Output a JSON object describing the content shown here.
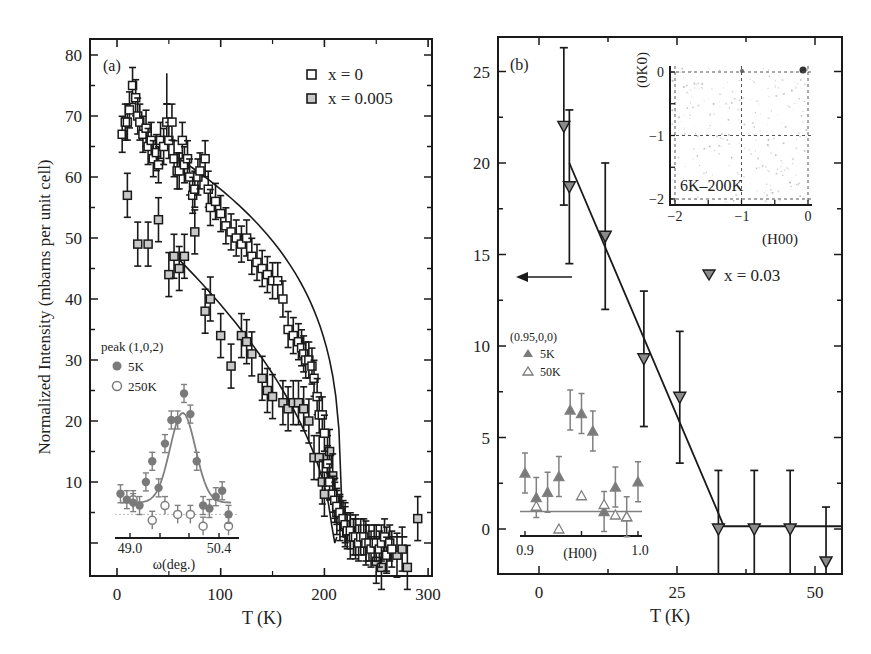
{
  "chart_data": [
    {
      "panel": "(a)",
      "type": "scatter",
      "title": "",
      "xlabel": "T (K)",
      "ylabel": "Normalized Intensity (mbarns per unit cell)",
      "xlim": [
        -25,
        305
      ],
      "ylim": [
        -5.5,
        82.5
      ],
      "xticks": [
        0,
        100,
        200,
        300
      ],
      "yticks": [
        10,
        20,
        30,
        40,
        50,
        60,
        70,
        80
      ],
      "grid": false,
      "legend_position": "upper right",
      "series": [
        {
          "name": "x = 0",
          "marker": "square-open",
          "x": [
            5,
            8,
            10,
            12,
            15,
            18,
            20,
            22,
            25,
            28,
            30,
            33,
            35,
            38,
            40,
            42,
            45,
            48,
            50,
            53,
            55,
            58,
            60,
            63,
            65,
            68,
            70,
            73,
            75,
            78,
            80,
            85,
            88,
            90,
            95,
            100,
            105,
            110,
            115,
            120,
            125,
            130,
            135,
            140,
            145,
            150,
            155,
            160,
            165,
            170,
            175,
            178,
            180,
            182,
            185,
            188,
            190,
            193,
            195,
            198,
            200,
            203,
            205,
            208,
            210,
            212,
            215,
            218,
            220,
            222,
            225,
            228,
            230,
            233,
            235,
            238,
            240,
            243,
            245,
            248,
            250,
            253,
            255,
            258,
            260,
            263,
            265
          ],
          "y": [
            67,
            69,
            69,
            71,
            75,
            73,
            70,
            69,
            67,
            68,
            65,
            66,
            63,
            64,
            62,
            66,
            65,
            69,
            66,
            69,
            63,
            61,
            61,
            66,
            62,
            63,
            60,
            57,
            58,
            60,
            61,
            63,
            58,
            55,
            56,
            54,
            52,
            51,
            50,
            49,
            50,
            47,
            46,
            45,
            44,
            43,
            43,
            40,
            35,
            34,
            33,
            32,
            31,
            30,
            30,
            29,
            27,
            24,
            21,
            21,
            18,
            13,
            10,
            8,
            7,
            6,
            5,
            4,
            3,
            2,
            2,
            1,
            1,
            0,
            1,
            1,
            0,
            0,
            -1,
            0,
            0,
            -1,
            0,
            1,
            -2,
            0,
            -1
          ],
          "fit": "power-law decay, T_N ≈ 215 K"
        },
        {
          "name": "x = 0.005",
          "marker": "square-grey",
          "x": [
            10,
            20,
            30,
            40,
            50,
            55,
            60,
            65,
            75,
            85,
            90,
            100,
            110,
            120,
            125,
            130,
            140,
            145,
            150,
            160,
            165,
            170,
            175,
            180,
            185,
            190,
            195,
            198,
            200,
            203,
            205,
            208,
            210,
            212,
            215,
            220,
            225,
            230,
            240,
            250,
            255,
            260,
            270,
            275,
            280,
            290
          ],
          "y": [
            57,
            49,
            49,
            53,
            44,
            47,
            45,
            47,
            51,
            38,
            40,
            34,
            29,
            34,
            33,
            31,
            27,
            25,
            24,
            23,
            22,
            23,
            23,
            22,
            20,
            14,
            14,
            10,
            8,
            14,
            15,
            11,
            7,
            5,
            4,
            3,
            1,
            1,
            0,
            -3,
            -4,
            -1,
            -2,
            -1,
            -4,
            4
          ],
          "fit": "linear decay to ≈ 205 K"
        }
      ],
      "inset": {
        "title": "peak (1,0,2)",
        "xlabel": "ω(deg.)",
        "xticks": [
          49.0,
          50.4
        ],
        "series": [
          {
            "name": "5K",
            "marker": "circle-filled",
            "x": [
              48.85,
              48.95,
              49.05,
              49.15,
              49.25,
              49.35,
              49.45,
              49.55,
              49.65,
              49.75,
              49.85,
              49.95,
              50.05,
              50.15,
              50.25,
              50.35,
              50.45,
              50.55
            ],
            "y": [
              7.5,
              6.5,
              6,
              5.5,
              9.5,
              13,
              8.5,
              16,
              20,
              20,
              24.5,
              21,
              13,
              5.5,
              5,
              7,
              8,
              4
            ]
          },
          {
            "name": "250K",
            "marker": "circle-open",
            "x": [
              49.05,
              49.35,
              49.55,
              49.75,
              49.95,
              50.15,
              50.55
            ],
            "y": [
              6.5,
              3,
              5.5,
              4,
              4,
              2,
              2
            ]
          }
        ],
        "fit": "gaussian peak centered ≈ 49.85°"
      }
    },
    {
      "panel": "(b)",
      "type": "scatter",
      "title": "",
      "xlabel": "T (K)",
      "ylabel": "",
      "xlim": [
        -7,
        55
      ],
      "ylim": [
        -2.4,
        26.4
      ],
      "xticks": [
        0,
        25,
        50
      ],
      "yticks": [
        0,
        5,
        10,
        15,
        20,
        25
      ],
      "grid": false,
      "series": [
        {
          "name": "x = 0.03",
          "marker": "triangle-down-grey",
          "x": [
            4.5,
            5.5,
            12,
            19,
            25.5,
            32.5,
            39,
            45.5,
            52
          ],
          "y": [
            22,
            18.7,
            16,
            9.3,
            7.2,
            0,
            0,
            0,
            -1.8
          ],
          "yerr": [
            4.3,
            4.2,
            4,
            3.7,
            3.6,
            3.2,
            3.2,
            3.2,
            3
          ],
          "fit": "linear to zero at T ≈ 33 K, then flat at 0"
        }
      ],
      "annotations": [
        "left arrow pointing to y-axis"
      ],
      "inset_map": {
        "label": "6K–200K",
        "xlabel": "(H00)",
        "ylabel": "(0K0)",
        "xticks": [
          -2,
          -1,
          0
        ],
        "yticks": [
          0,
          -1,
          -2
        ]
      },
      "inset": {
        "title": "(0.95,0,0)",
        "xlabel": "(H00)",
        "xticks": [
          0.9,
          1.0
        ],
        "series": [
          {
            "name": "5K",
            "marker": "triangle-up-filled",
            "x": [
              0.9,
              0.91,
              0.92,
              0.93,
              0.94,
              0.95,
              0.96,
              0.97,
              0.98,
              0.99,
              1.0
            ],
            "y": [
              3.2,
              1.8,
              2.1,
              3.0,
              6.8,
              6.6,
              5.6,
              1.0,
              2.4,
              0.7,
              2.7
            ]
          },
          {
            "name": "50K",
            "marker": "triangle-up-open",
            "x": [
              0.91,
              0.93,
              0.95,
              0.97,
              0.98,
              0.99
            ],
            "y": [
              1.3,
              0,
              1.9,
              1.4,
              0.8,
              0.7
            ]
          }
        ]
      }
    }
  ],
  "panel_a": {
    "label": "(a)",
    "xlabel": "T (K)",
    "ylabel": "Normalized Intensity (mbarns per unit cell)",
    "xtick_labels": [
      "0",
      "100",
      "200",
      "300"
    ],
    "ytick_labels": [
      "10",
      "20",
      "30",
      "40",
      "50",
      "60",
      "70",
      "80"
    ],
    "legend": [
      "x = 0",
      "x = 0.005"
    ],
    "inset_title": "peak (1,0,2)",
    "inset_legend": [
      "5K",
      "250K"
    ],
    "inset_xticks": [
      "49.0",
      "50.4"
    ],
    "inset_xlabel": "ω(deg.)"
  },
  "panel_b": {
    "label": "(b)",
    "xlabel": "T (K)",
    "xtick_labels": [
      "0",
      "25",
      "50"
    ],
    "ytick_labels": [
      "0",
      "5",
      "10",
      "15",
      "20",
      "25"
    ],
    "legend": "x = 0.03",
    "map_label": "6K–200K",
    "map_xlabel": "(H00)",
    "map_ylabel": "(0K0)",
    "map_xticks": [
      "−2",
      "−1",
      "0"
    ],
    "map_yticks": [
      "0",
      "−1",
      "−2"
    ],
    "inset_title": "(0.95,0,0)",
    "inset_legend": [
      "5K",
      "50K"
    ],
    "inset_xticks": [
      "0.9",
      "1.0"
    ],
    "inset_xlabel": "(H00)"
  },
  "colors": {
    "axis": "#1a1a1a",
    "grey_marker": "#8a8a8a",
    "light_grey_marker": "#c8c8c8",
    "inset_grey": "#808080"
  }
}
